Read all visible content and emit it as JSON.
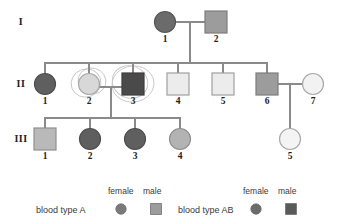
{
  "figure": {
    "type": "pedigree-chart",
    "generations": [
      {
        "label": "I",
        "y_center": 22
      },
      {
        "label": "II",
        "y_center": 84
      },
      {
        "label": "III",
        "y_center": 139
      }
    ]
  },
  "individuals": [
    {
      "id": "I-1",
      "generation": "I",
      "number": "1",
      "sex": "female",
      "shape": "circle",
      "fill": "#6b6b6b",
      "stroke": "#555555",
      "cx": 165,
      "cy": 22,
      "r": 10.5,
      "label_x": 165,
      "label_y": 34
    },
    {
      "id": "I-2",
      "generation": "I",
      "number": "2",
      "sex": "male",
      "shape": "square",
      "fill": "#9c9c9c",
      "stroke": "#7d7d7d",
      "cx": 216,
      "cy": 22,
      "r": 11,
      "label_x": 216,
      "label_y": 34
    },
    {
      "id": "II-1",
      "generation": "II",
      "number": "1",
      "sex": "female",
      "shape": "circle",
      "fill": "#5f5f5f",
      "stroke": "#4d4d4d",
      "cx": 45,
      "cy": 84,
      "r": 10.5,
      "label_x": 45,
      "label_y": 96
    },
    {
      "id": "II-2",
      "generation": "II",
      "number": "2",
      "sex": "female",
      "shape": "circle",
      "fill": "#d8d8d8",
      "stroke": "#a9a9a9",
      "cx": 89,
      "cy": 84,
      "r": 10.5,
      "label_x": 89,
      "label_y": 96
    },
    {
      "id": "II-3",
      "generation": "II",
      "number": "3",
      "sex": "male",
      "shape": "square",
      "fill": "#4a4a4a",
      "stroke": "#3c3c3c",
      "cx": 133,
      "cy": 84,
      "r": 11,
      "label_x": 133,
      "label_y": 96
    },
    {
      "id": "II-4",
      "generation": "II",
      "number": "4",
      "sex": "male",
      "shape": "square",
      "fill": "#ececec",
      "stroke": "#a0a0a0",
      "cx": 178,
      "cy": 84,
      "r": 11,
      "label_x": 178,
      "label_y": 96
    },
    {
      "id": "II-5",
      "generation": "II",
      "number": "5",
      "sex": "male",
      "shape": "square",
      "fill": "#ececec",
      "stroke": "#a0a0a0",
      "cx": 223,
      "cy": 84,
      "r": 11,
      "label_x": 223,
      "label_y": 96
    },
    {
      "id": "II-6",
      "generation": "II",
      "number": "6",
      "sex": "male",
      "shape": "square",
      "fill": "#9c9c9c",
      "stroke": "#7d7d7d",
      "cx": 267,
      "cy": 84,
      "r": 11,
      "label_x": 267,
      "label_y": 96
    },
    {
      "id": "II-7",
      "generation": "II",
      "number": "7",
      "sex": "female",
      "shape": "circle",
      "fill": "#f2f2f2",
      "stroke": "#a9a9a9",
      "cx": 313,
      "cy": 84,
      "r": 10.5,
      "label_x": 313,
      "label_y": 96
    },
    {
      "id": "III-1",
      "generation": "III",
      "number": "1",
      "sex": "male",
      "shape": "square",
      "fill": "#b9b9b9",
      "stroke": "#8f8f8f",
      "cx": 45,
      "cy": 139,
      "r": 11,
      "label_x": 45,
      "label_y": 151
    },
    {
      "id": "III-2",
      "generation": "III",
      "number": "2",
      "sex": "female",
      "shape": "circle",
      "fill": "#5f5f5f",
      "stroke": "#4d4d4d",
      "cx": 90,
      "cy": 139,
      "r": 10.5,
      "label_x": 90,
      "label_y": 151
    },
    {
      "id": "III-3",
      "generation": "III",
      "number": "3",
      "sex": "female",
      "shape": "circle",
      "fill": "#5f5f5f",
      "stroke": "#4d4d4d",
      "cx": 135,
      "cy": 139,
      "r": 10.5,
      "label_x": 135,
      "label_y": 151
    },
    {
      "id": "III-4",
      "generation": "III",
      "number": "4",
      "sex": "female",
      "shape": "circle",
      "fill": "#b3b3b3",
      "stroke": "#8f8f8f",
      "cx": 180,
      "cy": 139,
      "r": 10.5,
      "label_x": 180,
      "label_y": 151
    },
    {
      "id": "III-5",
      "generation": "III",
      "number": "5",
      "sex": "female",
      "shape": "circle",
      "fill": "#f4f4f4",
      "stroke": "#a9a9a9",
      "cx": 290,
      "cy": 139,
      "r": 10.5,
      "label_x": 290,
      "label_y": 151
    }
  ],
  "connectors": {
    "stroke": "#8a8a8a",
    "width": 2,
    "lines": [
      {
        "name": "mating-I1-I2",
        "x1": 176,
        "y1": 22,
        "x2": 205,
        "y2": 22
      },
      {
        "name": "descent-I-drop",
        "x1": 190,
        "y1": 22,
        "x2": 190,
        "y2": 63
      },
      {
        "name": "sibship-II",
        "x1": 45,
        "y1": 63,
        "x2": 267,
        "y2": 63
      },
      {
        "name": "stem-II-1",
        "x1": 45,
        "y1": 63,
        "x2": 45,
        "y2": 74
      },
      {
        "name": "stem-II-2",
        "x1": 89,
        "y1": 63,
        "x2": 89,
        "y2": 74
      },
      {
        "name": "stem-II-3",
        "x1": 133,
        "y1": 63,
        "x2": 133,
        "y2": 73
      },
      {
        "name": "stem-II-4",
        "x1": 178,
        "y1": 63,
        "x2": 178,
        "y2": 73
      },
      {
        "name": "stem-II-5",
        "x1": 223,
        "y1": 63,
        "x2": 223,
        "y2": 73
      },
      {
        "name": "stem-II-6",
        "x1": 267,
        "y1": 63,
        "x2": 267,
        "y2": 73
      },
      {
        "name": "mating-II2-II3",
        "x1": 100,
        "y1": 87,
        "x2": 122,
        "y2": 87
      },
      {
        "name": "descent-II-drop",
        "x1": 111,
        "y1": 87,
        "x2": 111,
        "y2": 118
      },
      {
        "name": "sibship-III",
        "x1": 45,
        "y1": 118,
        "x2": 180,
        "y2": 118
      },
      {
        "name": "stem-III-1",
        "x1": 45,
        "y1": 118,
        "x2": 45,
        "y2": 129
      },
      {
        "name": "stem-III-2",
        "x1": 90,
        "y1": 118,
        "x2": 90,
        "y2": 129
      },
      {
        "name": "stem-III-3",
        "x1": 135,
        "y1": 118,
        "x2": 135,
        "y2": 129
      },
      {
        "name": "stem-III-4",
        "x1": 180,
        "y1": 118,
        "x2": 180,
        "y2": 129
      },
      {
        "name": "mating-II6-II7",
        "x1": 278,
        "y1": 84,
        "x2": 302,
        "y2": 84
      },
      {
        "name": "descent-III5-drop",
        "x1": 290,
        "y1": 84,
        "x2": 290,
        "y2": 129
      }
    ]
  },
  "annotations": {
    "stroke": "#c9c4c9",
    "ellipses": [
      {
        "name": "handdrawn-circle-II2-a",
        "cx": 86,
        "cy": 83,
        "rx": 15,
        "ry": 14,
        "rot": -20
      },
      {
        "name": "handdrawn-circle-II2-b",
        "cx": 92,
        "cy": 81,
        "rx": 14,
        "ry": 13,
        "rot": 15
      },
      {
        "name": "handdrawn-circle-II3-a",
        "cx": 133,
        "cy": 84,
        "rx": 21,
        "ry": 18,
        "rot": -8
      },
      {
        "name": "handdrawn-circle-II3-b",
        "cx": 130,
        "cy": 82,
        "rx": 18,
        "ry": 16,
        "rot": 22
      }
    ]
  },
  "legend": {
    "columns": [
      {
        "name": "blood-type-a",
        "label": "blood type A",
        "female_header": "female",
        "male_header": "male",
        "female_fill": "#7a7a7a",
        "male_fill": "#9c9c9c"
      },
      {
        "name": "blood-type-ab",
        "label": "blood type AB",
        "female_header": "female",
        "male_header": "male",
        "female_fill": "#6b6b6b",
        "male_fill": "#5a5a5a"
      }
    ]
  }
}
